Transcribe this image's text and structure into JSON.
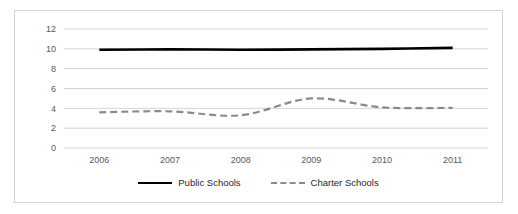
{
  "chart_data": {
    "type": "line",
    "title": "",
    "subtitle": "",
    "xlabel": "",
    "ylabel": "",
    "categories": [
      "2006",
      "2007",
      "2008",
      "2009",
      "2010",
      "2011"
    ],
    "x": [
      2006,
      2007,
      2008,
      2009,
      2010,
      2011
    ],
    "series": [
      {
        "name": "Public Schools",
        "values": [
          9.9,
          9.95,
          9.9,
          9.95,
          10.0,
          10.1
        ],
        "color": "#000000",
        "style": "solid"
      },
      {
        "name": "Charter Schools",
        "values": [
          3.6,
          3.7,
          3.3,
          5.0,
          4.1,
          4.05
        ],
        "color": "#8a8a8a",
        "style": "dashed"
      }
    ],
    "ylim": [
      0,
      12
    ],
    "yticks": [
      0,
      2,
      4,
      6,
      8,
      10,
      12
    ],
    "ytick_labels": [
      "0",
      "2",
      "4",
      "6",
      "8",
      "10",
      "12"
    ],
    "xtick_labels": [
      "2006",
      "2007",
      "2008",
      "2009",
      "2010",
      "2011"
    ],
    "grid": true,
    "grid_axis": "y",
    "legend": true,
    "legend_position": "bottom",
    "legend_entries": [
      {
        "label": "Public Schools",
        "marker": "solid-line",
        "color": "#000000"
      },
      {
        "label": "Charter Schools",
        "marker": "dashed-line",
        "color": "#8a8a8a"
      }
    ]
  },
  "axes": {
    "y_ticks": [
      {
        "label": "12",
        "value": 12
      },
      {
        "label": "10",
        "value": 10
      },
      {
        "label": "8",
        "value": 8
      },
      {
        "label": "6",
        "value": 6
      },
      {
        "label": "4",
        "value": 4
      },
      {
        "label": "2",
        "value": 2
      },
      {
        "label": "0",
        "value": 0
      }
    ],
    "x_ticks": [
      {
        "label": "2006"
      },
      {
        "label": "2007"
      },
      {
        "label": "2008"
      },
      {
        "label": "2009"
      },
      {
        "label": "2010"
      },
      {
        "label": "2011"
      }
    ]
  },
  "legend": {
    "entries": [
      {
        "label": "Public Schools"
      },
      {
        "label": "Charter Schools"
      }
    ]
  },
  "colors": {
    "public_schools": "#000000",
    "charter_schools": "#8a8a8a",
    "gridline": "#c8c8c8",
    "border": "#d4d4d4",
    "tick_text": "#595959",
    "background": "#ffffff"
  }
}
